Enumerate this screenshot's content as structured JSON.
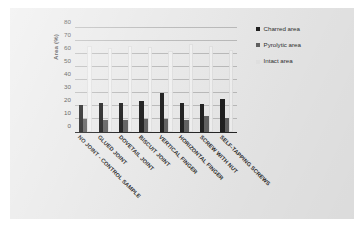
{
  "chart_data": {
    "type": "bar",
    "title": "",
    "subtitle": "",
    "xlabel": "",
    "ylabel": "Area (%)",
    "ylim": [
      0,
      80
    ],
    "yticks": [
      0,
      10,
      20,
      30,
      40,
      50,
      60,
      70,
      80
    ],
    "grid": true,
    "legend_position": "right",
    "categories": [
      "NO JOINT - CONTROL SAMPLE",
      "GLUED JOINT",
      "DOVETAIL JOINT",
      "BISCUIT JOINT",
      "VERTICAL FINGER",
      "HORIZONTAL FINGER",
      "SCREW WITH NUT",
      "SELF-TAPPING SCREWS"
    ],
    "series": [
      {
        "name": "Charred area",
        "color": "#1c1c1c",
        "values": [
          21,
          22.5,
          22.5,
          24,
          30,
          22.5,
          21.5,
          25.5
        ]
      },
      {
        "name": "Pyrolytic area",
        "color": "#5e5e5e",
        "values": [
          10,
          9.5,
          9.5,
          10,
          10,
          9.5,
          12.5,
          11
        ]
      },
      {
        "name": "Intact area",
        "color": "#f2f2f2",
        "values": [
          66.5,
          65,
          66,
          65.5,
          62,
          68,
          66,
          63
        ]
      }
    ]
  },
  "axis": {
    "y_title": "Area (%)"
  },
  "legend": {
    "items": [
      {
        "label": "Charred area",
        "color": "#1c1c1c"
      },
      {
        "label": "Pyrolytic area",
        "color": "#5e5e5e"
      },
      {
        "label": "Intact area",
        "color": "#e4e4e4"
      }
    ]
  }
}
